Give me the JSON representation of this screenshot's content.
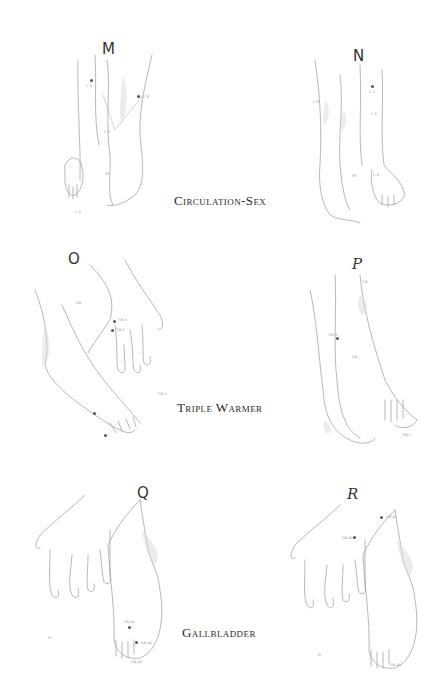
{
  "page": {
    "background": "#ffffff",
    "sections": [
      {
        "caption": "Circulation-Sex",
        "figures": [
          {
            "letter": "M",
            "points": [
              "C-3",
              "C-8",
              "C-5",
              "C-9",
              "SP"
            ]
          },
          {
            "letter": "N",
            "points": [
              "C-3",
              "C-5",
              "C-8",
              "C-9",
              "SP"
            ]
          }
        ]
      },
      {
        "caption": "Triple Warmer",
        "figures": [
          {
            "letter": "O",
            "points": [
              "TW-3",
              "TW-2",
              "GB",
              "TW-1"
            ]
          },
          {
            "letter": "P",
            "points": [
              "TW",
              "TW-3",
              "TW-1",
              "GB"
            ]
          }
        ]
      },
      {
        "caption": "Gallbladder",
        "figures": [
          {
            "letter": "Q",
            "points": [
              "GB-41",
              "GB-44",
              "GB-43",
              "SI"
            ]
          },
          {
            "letter": "R",
            "points": [
              "GB-40",
              "GB-41",
              "GB-44",
              "SI"
            ]
          }
        ]
      }
    ]
  }
}
